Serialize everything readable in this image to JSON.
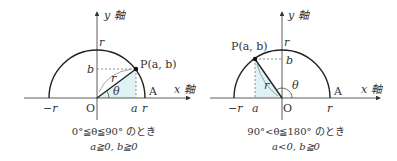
{
  "colors": {
    "stroke": "#222222",
    "text": "#333333",
    "fill_triangle": "#dff3f7",
    "dashed": "#666666"
  },
  "diagrams": [
    {
      "labels": {
        "y_axis": "y 軸",
        "x_axis": "x 軸",
        "top_r": "r",
        "b": "b",
        "point": "P(a, b)",
        "radius": "r",
        "theta": "θ",
        "A": "A",
        "neg_r": "−r",
        "O": "O",
        "a": "a",
        "pos_r": "r"
      },
      "caption": {
        "line1": "0°≦θ≦90° のとき",
        "line2": "a≧0, b≧0"
      }
    },
    {
      "labels": {
        "y_axis": "y 軸",
        "x_axis": "x 軸",
        "top_r": "r",
        "b": "b",
        "point": "P(a, b)",
        "radius": "r",
        "theta": "θ",
        "A": "A",
        "neg_r": "−r",
        "O": "O",
        "a": "a",
        "pos_r": "r"
      },
      "caption": {
        "line1": "90°<θ≦180° のとき",
        "line2": "a<0, b≧0"
      }
    }
  ]
}
